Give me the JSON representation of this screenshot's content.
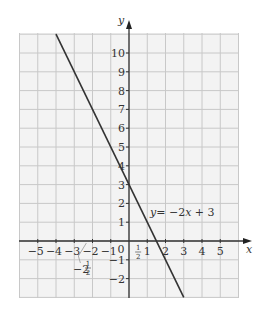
{
  "chart_data": {
    "type": "line",
    "title": "",
    "xlabel": "x",
    "ylabel": "y",
    "xlim": [
      -6,
      6
    ],
    "ylim": [
      -3,
      11
    ],
    "grid": true,
    "x_ticks": [
      "-5",
      "-4",
      "-3",
      "-2",
      "-1",
      "0",
      "1",
      "2",
      "3",
      "4",
      "5"
    ],
    "y_ticks": [
      "-2",
      "-1",
      "1",
      "2",
      "3",
      "4",
      "5",
      "6",
      "7",
      "8",
      "9",
      "10"
    ],
    "series": [
      {
        "name": "y = -2x + 3",
        "equation": "y = -2x + 3",
        "x": [
          -4,
          3
        ],
        "y": [
          11,
          -3
        ]
      }
    ],
    "annotations": [
      {
        "text": "1/2",
        "x": 0.5,
        "y": 0,
        "note": "fraction label near origin on x-axis"
      },
      {
        "text": "-2 1/2",
        "x": -2.5,
        "y": 0,
        "note": "mixed number label with pointer to x = -2.5"
      },
      {
        "text": "y = -2x + 3",
        "note": "line label"
      }
    ]
  },
  "labels": {
    "x_axis": "x",
    "y_axis": "y",
    "line_label_y": "y",
    "line_label_eq": "= −2",
    "line_label_x": "x",
    "line_label_rest": " + 3",
    "half_num": "1",
    "half_den": "2",
    "mixed_whole": "−2",
    "mixed_num": "1",
    "mixed_den": "2",
    "zero": "0"
  }
}
